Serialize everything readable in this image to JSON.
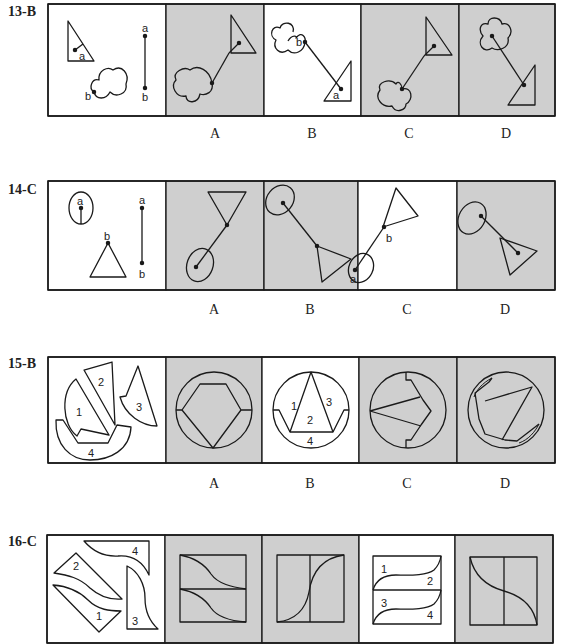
{
  "colors": {
    "panel_gray": "#cfcfcf",
    "panel_white": "#ffffff",
    "stroke": "#1a1a1a"
  },
  "questions": [
    {
      "id": "13-B",
      "label": "13-B",
      "answer": "B",
      "stimulus": {
        "description": "right triangle with point a, cloud shape with point b, segment a-b",
        "point_labels": [
          "a",
          "b",
          "a",
          "b"
        ]
      },
      "options": [
        {
          "letter": "A",
          "background": "gray"
        },
        {
          "letter": "B",
          "background": "white",
          "point_labels": [
            "b",
            "a"
          ]
        },
        {
          "letter": "C",
          "background": "gray"
        },
        {
          "letter": "D",
          "background": "gray"
        }
      ]
    },
    {
      "id": "14-C",
      "label": "14-C",
      "answer": "C",
      "stimulus": {
        "description": "ellipse with point a, triangle with vertex b, segment a-b",
        "point_labels": [
          "a",
          "b",
          "a",
          "b"
        ]
      },
      "options": [
        {
          "letter": "A",
          "background": "gray"
        },
        {
          "letter": "B",
          "background": "gray"
        },
        {
          "letter": "C",
          "background": "white",
          "point_labels": [
            "b",
            "a"
          ]
        },
        {
          "letter": "D",
          "background": "gray"
        }
      ]
    },
    {
      "id": "15-B",
      "label": "15-B",
      "answer": "B",
      "stimulus": {
        "description": "four pieces numbered 1-4 forming a circle",
        "piece_labels": [
          "1",
          "2",
          "3",
          "4"
        ]
      },
      "options": [
        {
          "letter": "A",
          "background": "gray"
        },
        {
          "letter": "B",
          "background": "white",
          "piece_labels": [
            "1",
            "2",
            "3",
            "4"
          ]
        },
        {
          "letter": "C",
          "background": "gray"
        },
        {
          "letter": "D",
          "background": "gray"
        }
      ]
    },
    {
      "id": "16-C",
      "label": "16-C",
      "answer": "C",
      "stimulus": {
        "description": "four curved pieces numbered 1-4 forming a rectangle",
        "piece_labels": [
          "1",
          "2",
          "3",
          "4"
        ]
      },
      "options": [
        {
          "letter": "A",
          "background": "gray"
        },
        {
          "letter": "B",
          "background": "gray"
        },
        {
          "letter": "C",
          "background": "white",
          "piece_labels": [
            "1",
            "2",
            "3",
            "4"
          ]
        },
        {
          "letter": "D",
          "background": "gray"
        }
      ]
    }
  ]
}
